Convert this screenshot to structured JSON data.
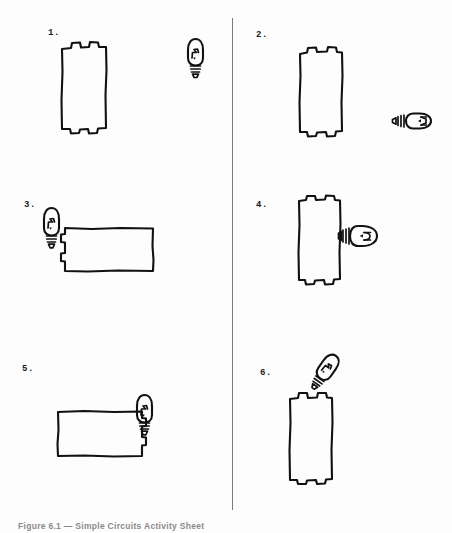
{
  "document": {
    "type": "worksheet-figure",
    "caption": "Figure 6.1 — Simple Circuits Activity Sheet",
    "background_color": "#fdfdfd",
    "ink_color": "#111111"
  },
  "layout": {
    "divider": {
      "orientation": "vertical",
      "x": 232,
      "top": 18,
      "height": 492,
      "color": "#7a7a7a"
    },
    "columns": 2,
    "rows": 3
  },
  "panels": [
    {
      "number": "1.",
      "name": "panel-1",
      "column": "left",
      "battery": {
        "orientation": "vertical",
        "terminals": "top-and-bottom"
      },
      "bulb": {
        "orientation": "vertical",
        "base": "down",
        "touching_battery": false
      },
      "arrangement": "battery and bulb separated, not connected"
    },
    {
      "number": "2.",
      "name": "panel-2",
      "column": "right",
      "battery": {
        "orientation": "vertical",
        "terminals": "top-and-bottom"
      },
      "bulb": {
        "orientation": "horizontal",
        "base": "left",
        "touching_battery": false
      },
      "arrangement": "battery and bulb separated, bulb lying on its side"
    },
    {
      "number": "3.",
      "name": "panel-3",
      "column": "left",
      "battery": {
        "orientation": "horizontal",
        "terminals": "left-side"
      },
      "bulb": {
        "orientation": "vertical",
        "base": "down",
        "touching_battery": true
      },
      "arrangement": "bulb base contacts left terminal of horizontal battery"
    },
    {
      "number": "4.",
      "name": "panel-4",
      "column": "right",
      "battery": {
        "orientation": "vertical",
        "terminals": "top-and-bottom"
      },
      "bulb": {
        "orientation": "horizontal",
        "base": "left",
        "touching_battery": true
      },
      "arrangement": "bulb base contacts right side of vertical battery"
    },
    {
      "number": "5.",
      "name": "panel-5",
      "column": "left",
      "battery": {
        "orientation": "horizontal",
        "terminals": "right-side"
      },
      "bulb": {
        "orientation": "vertical",
        "base": "down",
        "touching_battery": true
      },
      "arrangement": "bulb base contacts right terminal of horizontal battery"
    },
    {
      "number": "6.",
      "name": "panel-6",
      "column": "right",
      "battery": {
        "orientation": "vertical",
        "terminals": "top-and-bottom"
      },
      "bulb": {
        "orientation": "tilted",
        "tilt_degrees": 35,
        "base": "lower-left",
        "touching_battery": true
      },
      "arrangement": "bulb tilted, base contacts top terminal of vertical battery"
    }
  ]
}
